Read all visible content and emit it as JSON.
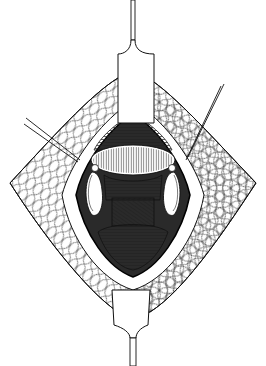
{
  "figure": {
    "colors": {
      "ink": "#111111",
      "background": "#ffffff",
      "cavity": "#2a2a2a"
    }
  }
}
